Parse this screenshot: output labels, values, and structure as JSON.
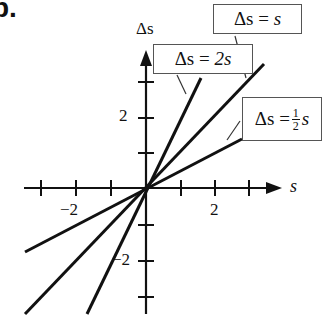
{
  "figure": {
    "part_label": "b.",
    "x_axis_label": "s",
    "y_axis_label": "Δs",
    "x_tick_labels": [
      "−2",
      "2"
    ],
    "y_tick_labels": [
      "2",
      "−2"
    ],
    "lines": [
      {
        "name": "Δs = 2s",
        "slope": 2,
        "label_lhs": "Δs",
        "label_eq": "=",
        "label_rhs": "2s"
      },
      {
        "name": "Δs = s",
        "slope": 1,
        "label_lhs": "Δs",
        "label_eq": "=",
        "label_rhs": "s"
      },
      {
        "name": "Δs = ½s",
        "slope": 0.5,
        "label_lhs": "Δs",
        "label_eq": "=",
        "label_num": "1",
        "label_den": "2",
        "label_var": "s"
      }
    ],
    "x_range": [
      -3.4,
      3.4
    ],
    "y_range": [
      -3.4,
      3.2
    ],
    "colors": {
      "ink": "#111111",
      "box_border": "#555555"
    }
  }
}
